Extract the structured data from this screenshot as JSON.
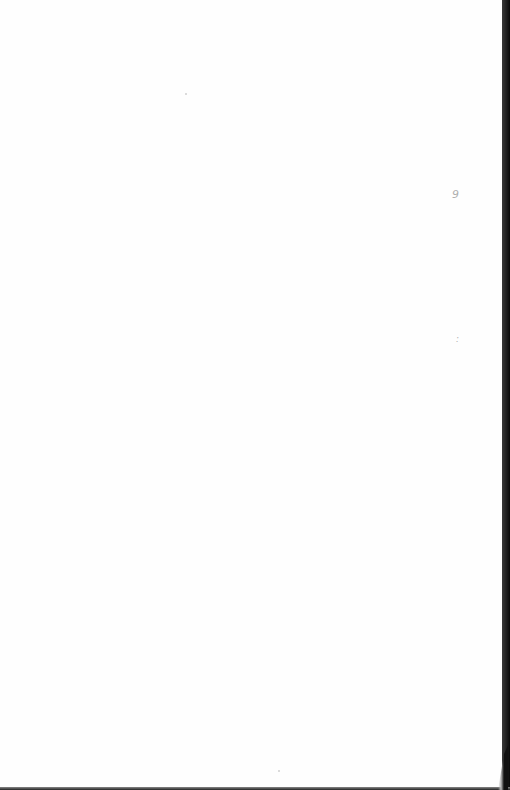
{
  "document": {
    "type": "blank scanned page",
    "marks": [
      {
        "text": "9",
        "x": 452,
        "y": 190
      },
      {
        "text": ":",
        "x": 456,
        "y": 338
      }
    ]
  }
}
